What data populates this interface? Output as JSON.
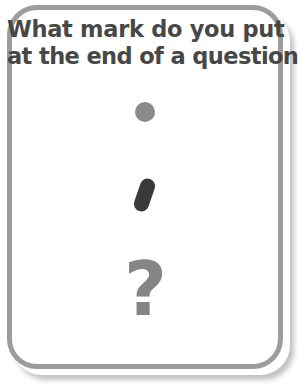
{
  "card": {
    "border_color": "#9c9c9c",
    "background_color": "#ffffff",
    "shadow_color": "#787878"
  },
  "question": {
    "line1": "What mark do you put",
    "line2": "at the end of a question?",
    "text_color": "#474747"
  },
  "answers": {
    "options": [
      {
        "id": "period",
        "symbol": ".",
        "name": "period",
        "color": "#8a8a8a"
      },
      {
        "id": "comma",
        "symbol": ",",
        "name": "comma",
        "color": "#3a3a3a"
      },
      {
        "id": "question-mark",
        "symbol": "?",
        "name": "question mark",
        "color": "#858585"
      }
    ]
  }
}
